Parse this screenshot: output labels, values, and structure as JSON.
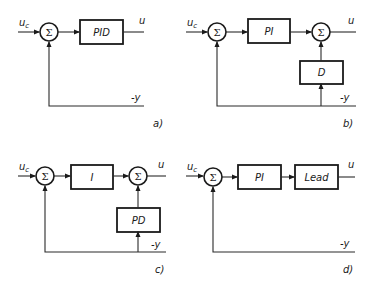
{
  "diagrams": [
    {
      "id": "a",
      "caption": "a)",
      "input": "u",
      "input_sub": "c",
      "output": "u",
      "feedback": "-y",
      "sum_symbol": "Σ",
      "blocks": [
        "PID"
      ]
    },
    {
      "id": "b",
      "caption": "b)",
      "input": "u",
      "input_sub": "c",
      "output": "u",
      "feedback": "-y",
      "sum_symbol": "Σ",
      "blocks": [
        "PI",
        "D"
      ]
    },
    {
      "id": "c",
      "caption": "c)",
      "input": "u",
      "input_sub": "c",
      "output": "u",
      "feedback": "-y",
      "sum_symbol": "Σ",
      "blocks": [
        "I",
        "PD"
      ]
    },
    {
      "id": "d",
      "caption": "d)",
      "input": "u",
      "input_sub": "c",
      "output": "u",
      "feedback": "-y",
      "sum_symbol": "Σ",
      "blocks": [
        "PI",
        "Lead"
      ]
    }
  ]
}
